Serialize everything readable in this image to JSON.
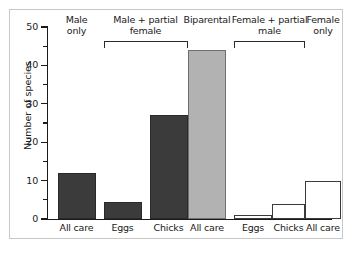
{
  "chart_data": {
    "type": "bar",
    "title": "",
    "xlabel": "",
    "ylabel": "Number of species",
    "ylim": [
      0,
      50
    ],
    "ytick_labels": [
      "0",
      "10",
      "20",
      "30",
      "40",
      "50"
    ],
    "ytick_values": [
      0,
      10,
      20,
      30,
      40,
      50
    ],
    "yminor_values": [
      5,
      15,
      25,
      35,
      45
    ],
    "grid": false,
    "legend": "none",
    "categories": [
      "All care",
      "Eggs",
      "Chicks",
      "All care",
      "Eggs",
      "Chicks",
      "All care"
    ],
    "values": [
      12,
      4.5,
      27,
      44,
      1,
      4,
      10
    ],
    "bar_styles": [
      "dark",
      "dark",
      "dark",
      "mid",
      "light",
      "light",
      "light"
    ],
    "colors": {
      "dark": "#3b3b3b",
      "mid": "#b2b2b2",
      "light": "#ffffff",
      "outline": "#2a2a2a",
      "axis": "#1a1a1a",
      "frame": "#c8c8c8"
    },
    "groups": [
      {
        "label": "Male\nonly",
        "line1": "Male",
        "line2": "only",
        "bars": [
          0
        ],
        "bracket": false
      },
      {
        "label": "Male + partial female",
        "line1": "Male + partial",
        "line2": "female",
        "bars": [
          1,
          2
        ],
        "bracket": true
      },
      {
        "label": "Biparental",
        "line1": "Biparental",
        "line2": "",
        "bars": [
          3
        ],
        "bracket": false
      },
      {
        "label": "Female + partial male",
        "line1": "Female + partial",
        "line2": "male",
        "bars": [
          4,
          5
        ],
        "bracket": true
      },
      {
        "label": "Female only",
        "line1": "Female",
        "line2": "only",
        "bars": [
          6
        ],
        "bracket": false
      }
    ]
  }
}
